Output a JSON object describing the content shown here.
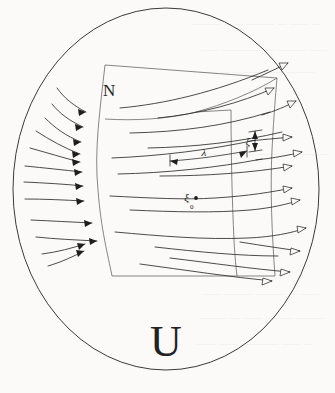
{
  "figure": {
    "outer_domain_label": "U",
    "surface_label": "N",
    "base_point_label": "ξ",
    "base_point_subscript": "0",
    "length_label": "λ",
    "transverse_label": "ξ",
    "background_color": "#fbfaf8",
    "ink_color": "#2c2c2c",
    "outline_color": "#3a3a3a",
    "region_color": "#5d5d5d"
  },
  "elements": {
    "outer_ellipse": {
      "name": "U",
      "center_x": 166,
      "center_y": 189,
      "radius_x": 153,
      "radius_y": 181
    },
    "surface_region": {
      "name": "N",
      "description": "curved quadrilateral transversal section"
    },
    "flow_arrows_left_count": 11,
    "flow_arrows_right_count": 12,
    "arrowhead_style_left": "solid",
    "arrowhead_style_right": "open"
  },
  "bleed_through_text": [
    "—  ——  — ———  ——  ———",
    "——  ——— —  ————  ——",
    "———  ——  ———  —  ——",
    "—  ————  —— ——  ———",
    "——  — ———  ———  ——",
    "———  ——— ——  —  ———",
    "— ——  ————  ——  ——"
  ]
}
